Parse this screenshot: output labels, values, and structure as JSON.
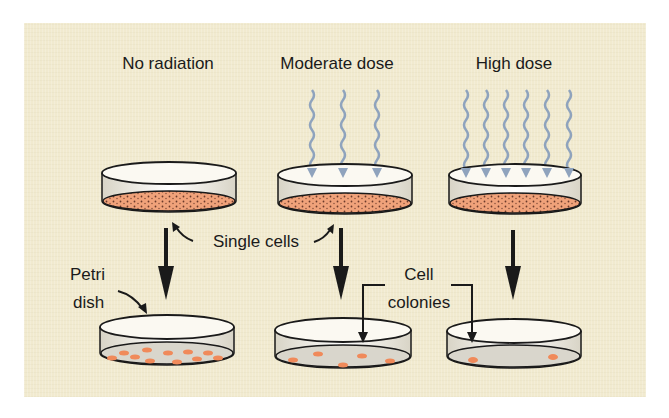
{
  "diagram": {
    "columns": [
      {
        "heading": "No radiation",
        "rays": 0,
        "colonies": 11
      },
      {
        "heading": "Moderate dose",
        "rays": 3,
        "colonies": 6
      },
      {
        "heading": "High dose",
        "rays": 6,
        "colonies": 2
      }
    ],
    "labels": {
      "single_cells": "Single cells",
      "petri_line1": "Petri",
      "petri_line2": "dish",
      "cell_line1": "Cell",
      "cell_line2": "colonies"
    },
    "colors": {
      "background": "#f1eacf",
      "cell_layer": "#f0a27a",
      "colony": "#f08a5a",
      "ray": "#8fa3bd",
      "agar": "#d9d6cc",
      "outline": "#1a1a1a"
    }
  }
}
